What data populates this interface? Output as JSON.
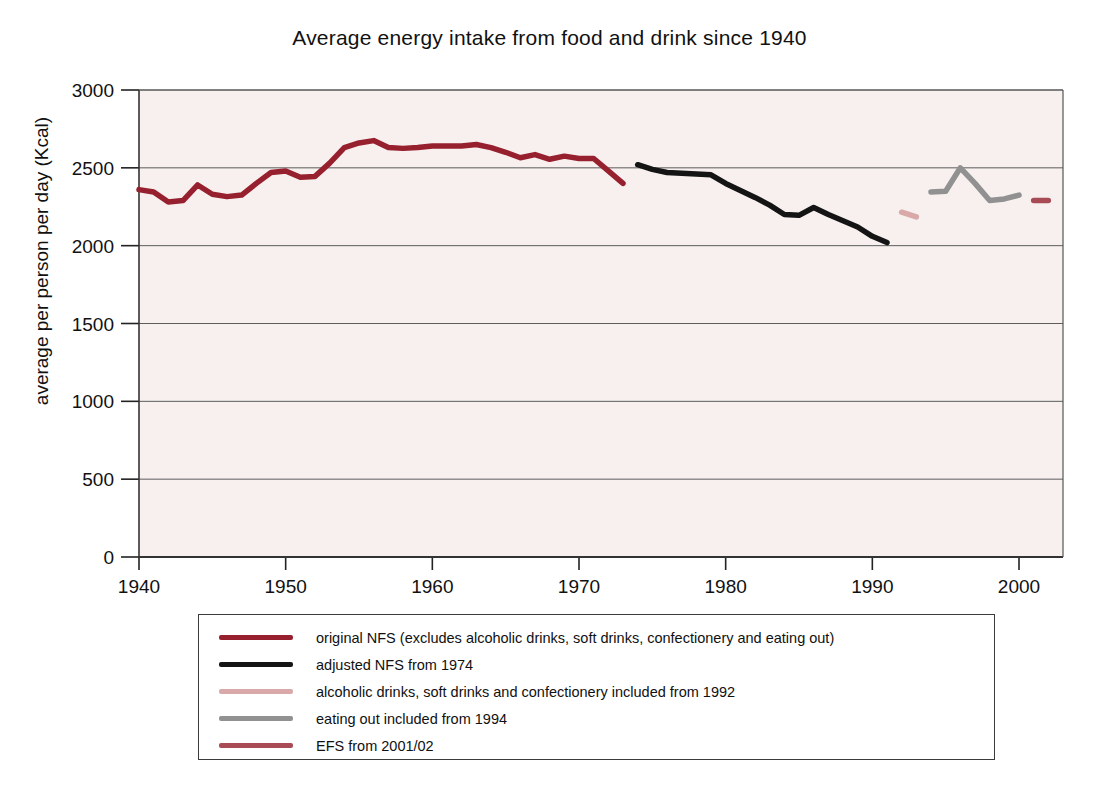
{
  "chart_data": {
    "type": "line",
    "title": "Average energy intake from food and drink since 1940",
    "xlabel": "",
    "ylabel": "average per person per day (Kcal)",
    "xlim": [
      1940,
      2003
    ],
    "ylim": [
      0,
      3000
    ],
    "xticks": [
      1940,
      1950,
      1960,
      1970,
      1980,
      1990,
      2000
    ],
    "xticklabels": [
      "1940",
      "1950",
      "1960",
      "1970",
      "1980",
      "1990",
      "2000"
    ],
    "yticks": [
      0,
      500,
      1000,
      1500,
      2000,
      2500,
      3000
    ],
    "yticklabels": [
      "0",
      "500",
      "1000",
      "1500",
      "2000",
      "2500",
      "3000"
    ],
    "grid": "horizontal",
    "legend_position": "below-axes",
    "plot_background": "#f7f0ef",
    "series": [
      {
        "name": "original NFS (excludes alcoholic drinks, soft drinks, confectionery and eating out)",
        "color": "#97202f",
        "x": [
          1940,
          1941,
          1942,
          1943,
          1944,
          1945,
          1946,
          1947,
          1948,
          1949,
          1950,
          1951,
          1952,
          1953,
          1954,
          1955,
          1956,
          1957,
          1958,
          1959,
          1960,
          1961,
          1962,
          1963,
          1964,
          1965,
          1966,
          1967,
          1968,
          1969,
          1970,
          1971,
          1972,
          1973
        ],
        "values": [
          2360,
          2345,
          2280,
          2290,
          2390,
          2330,
          2315,
          2325,
          2400,
          2470,
          2480,
          2440,
          2445,
          2530,
          2630,
          2660,
          2675,
          2630,
          2625,
          2630,
          2640,
          2640,
          2640,
          2650,
          2630,
          2600,
          2565,
          2585,
          2555,
          2575,
          2560,
          2560,
          2480,
          2400
        ]
      },
      {
        "name": "adjusted NFS from 1974",
        "color": "#141414",
        "x": [
          1974,
          1975,
          1976,
          1977,
          1978,
          1979,
          1980,
          1981,
          1982,
          1983,
          1984,
          1985,
          1986,
          1987,
          1988,
          1989,
          1990,
          1991
        ],
        "values": [
          2520,
          2490,
          2470,
          2465,
          2460,
          2455,
          2400,
          2355,
          2310,
          2260,
          2200,
          2195,
          2245,
          2200,
          2160,
          2120,
          2060,
          2020
        ]
      },
      {
        "name": "alcoholic drinks, soft drinks and confectionery included from 1992",
        "color": "#d9a9a9",
        "x": [
          1992,
          1993
        ],
        "values": [
          2215,
          2185
        ]
      },
      {
        "name": "eating out included from 1994",
        "color": "#919191",
        "x": [
          1994,
          1995,
          1996,
          1997,
          1998,
          1999,
          2000
        ],
        "values": [
          2345,
          2350,
          2500,
          2400,
          2290,
          2300,
          2325
        ]
      },
      {
        "name": "EFS from 2001/02",
        "color": "#a84b55",
        "x": [
          2001,
          2002
        ],
        "values": [
          2290,
          2290
        ]
      }
    ]
  },
  "legend": {
    "items": [
      {
        "label": "original NFS (excludes alcoholic drinks, soft drinks, confectionery and eating out)",
        "color": "#97202f"
      },
      {
        "label": "adjusted NFS from 1974",
        "color": "#141414"
      },
      {
        "label": "alcoholic drinks, soft drinks and confectionery included from 1992",
        "color": "#d9a9a9"
      },
      {
        "label": "eating out included from 1994",
        "color": "#919191"
      },
      {
        "label": "EFS from 2001/02",
        "color": "#a84b55"
      }
    ]
  }
}
